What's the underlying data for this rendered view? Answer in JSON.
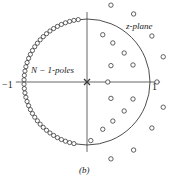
{
  "figure": {
    "caption": "(b)",
    "plane_label": "z-plane",
    "poles_label": "N − 1-poles",
    "left_tick_label": "−1",
    "right_tick_label": "1",
    "stroke_color": "#3a3a3a",
    "axis_color": "#555555",
    "background": "#ffffff"
  },
  "chart_data": {
    "type": "scatter",
    "title": "(b)",
    "subtitle": "z-plane pole-zero plot",
    "xlabel": "Re",
    "ylabel": "Im",
    "xlim": [
      -1.15,
      1.15
    ],
    "ylim": [
      -1.15,
      1.15
    ],
    "grid": false,
    "legend": null,
    "annotations": [
      {
        "text": "z-plane",
        "x": 0.62,
        "y": 0.95
      },
      {
        "text": "N − 1-poles",
        "x": -0.55,
        "y": 0.25
      },
      {
        "text": "−1",
        "x": -1.12,
        "y": -0.04
      },
      {
        "text": "1",
        "x": 1.05,
        "y": -0.06
      }
    ],
    "unit_circle": {
      "center": [
        0,
        0
      ],
      "radius": 1.0,
      "drawn": true
    },
    "axes": {
      "real_axis": [
        -1.13,
        1.16
      ],
      "imag_axis": [
        -1.11,
        1.11
      ],
      "center_px": [
        87,
        82
      ],
      "radius_px": 63
    },
    "series": [
      {
        "name": "poles-on-unit-circle",
        "marker": "open-circle",
        "count": 41,
        "description": "N − 1 poles densely spaced on the left arc of the unit circle",
        "angles_deg": [
          98,
          102,
          106,
          110,
          114,
          118,
          122,
          126,
          130,
          134,
          138,
          142,
          146,
          150,
          154,
          158,
          162,
          166,
          170,
          174,
          178,
          182,
          186,
          190,
          194,
          198,
          202,
          206,
          210,
          214,
          218,
          222,
          226,
          230,
          234,
          238,
          242,
          246,
          250,
          254,
          258
        ],
        "radius": 1.0
      },
      {
        "name": "pole-at-origin",
        "marker": "x",
        "count": 1,
        "points": [
          [
            0,
            0
          ]
        ]
      },
      {
        "name": "zeros",
        "marker": "open-circle",
        "count": 21,
        "points": [
          [
            0.38,
            1.22
          ],
          [
            0.74,
            1.08
          ],
          [
            0.25,
            0.75
          ],
          [
            0.41,
            0.62
          ],
          [
            1.03,
            0.73
          ],
          [
            0.59,
            0.46
          ],
          [
            1.21,
            0.4
          ],
          [
            0.38,
            0.26
          ],
          [
            0.73,
            0.27
          ],
          [
            0.33,
            0.0
          ],
          [
            1.11,
            0.0
          ],
          [
            0.38,
            -0.26
          ],
          [
            0.73,
            -0.27
          ],
          [
            0.59,
            -0.46
          ],
          [
            1.21,
            -0.4
          ],
          [
            0.25,
            -0.75
          ],
          [
            0.41,
            -0.62
          ],
          [
            1.03,
            -0.73
          ],
          [
            0.38,
            -1.22
          ],
          [
            0.74,
            -1.08
          ],
          [
            0.06,
            -0.93
          ]
        ]
      }
    ]
  }
}
